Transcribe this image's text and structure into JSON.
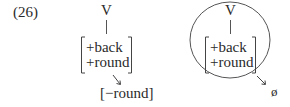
{
  "example_number": "(26)",
  "left_diagram": {
    "node": "V",
    "features": [
      "+back",
      "+round"
    ],
    "result": "[−round]"
  },
  "right_diagram": {
    "node": "V",
    "features": [
      "+back",
      "+round"
    ],
    "result": "ø",
    "encircled": true
  }
}
